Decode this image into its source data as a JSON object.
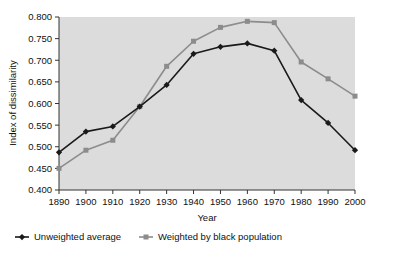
{
  "chart_data": {
    "type": "line",
    "title": "",
    "xlabel": "Year",
    "ylabel": "Index of dissimilarity",
    "x": [
      1890,
      1900,
      1910,
      1920,
      1930,
      1940,
      1950,
      1960,
      1970,
      1980,
      1990,
      2000
    ],
    "xticklabels": [
      "1890",
      "1900",
      "1910",
      "1920",
      "1930",
      "1940",
      "1950",
      "1960",
      "1970",
      "1980",
      "1990",
      "2000"
    ],
    "yticklabels": [
      "0.400",
      "0.450",
      "0.500",
      "0.550",
      "0.600",
      "0.650",
      "0.700",
      "0.750",
      "0.800"
    ],
    "yticks": [
      0.4,
      0.45,
      0.5,
      0.55,
      0.6,
      0.65,
      0.7,
      0.75,
      0.8
    ],
    "xlim": [
      1890,
      2000
    ],
    "ylim": [
      0.4,
      0.8
    ],
    "grid": false,
    "legend_position": "below-left",
    "plot_background": "#dcdcdc",
    "series": [
      {
        "name": "Unweighted average",
        "color": "#1a1a1a",
        "marker": "diamond",
        "values": [
          0.487,
          0.535,
          0.547,
          0.593,
          0.643,
          0.715,
          0.731,
          0.739,
          0.722,
          0.608,
          0.555,
          0.492
        ]
      },
      {
        "name": "Weighted by black population",
        "color": "#8c8c8c",
        "marker": "square",
        "values": [
          0.45,
          0.492,
          0.515,
          0.593,
          0.686,
          0.744,
          0.776,
          0.79,
          0.787,
          0.696,
          0.657,
          0.617
        ]
      }
    ]
  }
}
